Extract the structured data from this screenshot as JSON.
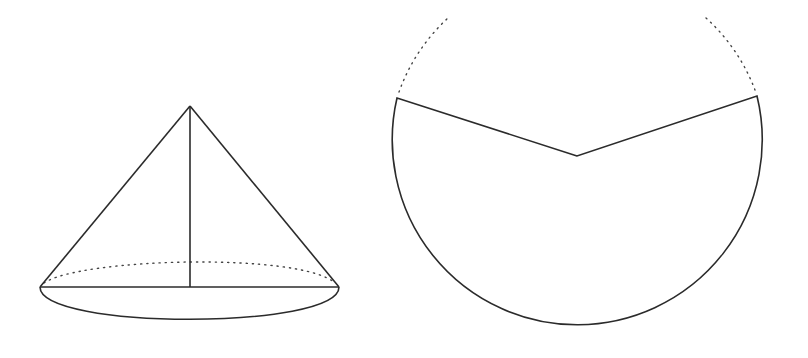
{
  "figure": {
    "colors": {
      "line": "#2b2b2b",
      "background": "#ffffff"
    }
  },
  "cone": {
    "apex": [
      190,
      106
    ],
    "base_center": [
      190,
      287
    ],
    "base_left": [
      40,
      287
    ],
    "base_right": [
      339,
      287
    ],
    "base_rx": 150,
    "base_ry": 35
  },
  "sector": {
    "center": [
      577,
      156
    ],
    "radius": 185,
    "left_end": [
      397,
      98
    ],
    "right_end": [
      757,
      96
    ]
  }
}
